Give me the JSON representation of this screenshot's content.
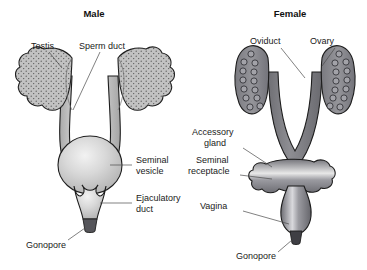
{
  "figure": {
    "type": "biological-diagram",
    "background_color": "#ffffff"
  },
  "panels": {
    "male": {
      "title": "Male",
      "labels": {
        "testis": "Testis",
        "sperm_duct": "Sperm duct",
        "seminal_vesicle_line1": "Seminal",
        "seminal_vesicle_line2": "vesicle",
        "ejaculatory_duct_line1": "Ejaculatory",
        "ejaculatory_duct_line2": "duct",
        "gonopore": "Gonopore"
      },
      "colors": {
        "testis_fill": "#b9b9b9",
        "duct_fill": "#d2d2d2",
        "vesicle_fill": "#cfcfcf",
        "gonopore_fill": "#55555a",
        "outline": "#1d1d1d"
      }
    },
    "female": {
      "title": "Female",
      "labels": {
        "oviduct": "Oviduct",
        "ovary": "Ovary",
        "accessory_gland_line1": "Accessory",
        "accessory_gland_line2": "gland",
        "seminal_receptacle_line1": "Seminal",
        "seminal_receptacle_line2": "receptacle",
        "vagina": "Vagina",
        "gonopore": "Gonopore"
      },
      "colors": {
        "ovary_fill": "#8e8e92",
        "ovum_fill": "#9c9ca0",
        "oviduct_fill": "#7d7d82",
        "gland_fill": "#8a8a8f",
        "vagina_fill": "#8e8e93",
        "gonopore_fill": "#3f3f44",
        "outline": "#1d1d1d"
      },
      "ova_count_left": 13,
      "ova_count_right": 13
    }
  }
}
